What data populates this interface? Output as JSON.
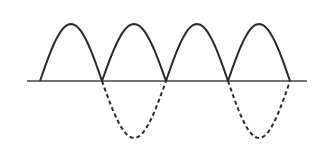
{
  "figure": {
    "title": "",
    "colors": {
      "background": "#ffffff",
      "stroke": "#2a2a2a",
      "axis": "#444444"
    },
    "axis": {
      "y": 81,
      "x_start": 27,
      "x_end": 307
    },
    "zero_crossings_x": [
      40,
      102,
      166,
      228,
      290
    ],
    "peak_y": 24,
    "trough_y": 138,
    "solid_humps": 4,
    "dashed_lobes_between": [
      [
        102,
        166
      ],
      [
        228,
        290
      ]
    ]
  }
}
